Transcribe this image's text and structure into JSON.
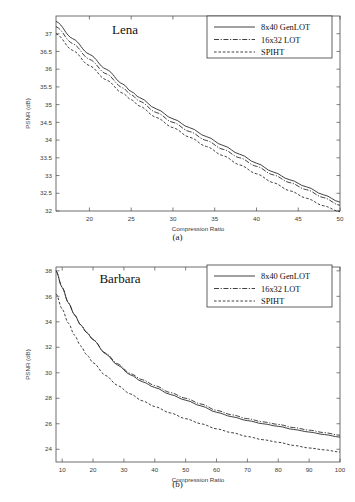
{
  "figure": {
    "caption_a": "(a)",
    "caption_b": "(b)",
    "axis_x_label": "Compression Ratio",
    "axis_y_label": "PSNR (dB)"
  },
  "legend": {
    "series1": "8x40 GenLOT",
    "series2": "16x32 LOT",
    "series3": "SPIHT"
  },
  "chart_data": [
    {
      "type": "line",
      "title": "Lena",
      "xlabel": "Compression Ratio",
      "ylabel": "PSNR (dB)",
      "xlim": [
        16,
        50
      ],
      "ylim": [
        32,
        37.5
      ],
      "xticks": [
        20,
        25,
        30,
        35,
        40,
        45,
        50
      ],
      "yticks": [
        32,
        32.5,
        33,
        33.5,
        34,
        34.5,
        35,
        35.5,
        36,
        36.5,
        37
      ],
      "grid": false,
      "legend_position": "top-right",
      "x": [
        16,
        18,
        20,
        22,
        24,
        25,
        26,
        28,
        30,
        32,
        34,
        36,
        38,
        40,
        42,
        44,
        46,
        48,
        50
      ],
      "series": [
        {
          "name": "8x40 GenLOT",
          "style": "solid",
          "values": [
            37.35,
            36.86,
            36.42,
            36.0,
            35.58,
            35.37,
            35.2,
            34.88,
            34.6,
            34.35,
            34.1,
            33.85,
            33.6,
            33.35,
            33.1,
            32.88,
            32.68,
            32.46,
            32.25
          ]
        },
        {
          "name": "16x32 LOT",
          "style": "dashdot",
          "values": [
            37.2,
            36.72,
            36.28,
            35.87,
            35.47,
            35.28,
            35.1,
            34.78,
            34.5,
            34.24,
            33.99,
            33.74,
            33.5,
            33.26,
            33.02,
            32.8,
            32.6,
            32.38,
            32.16
          ]
        },
        {
          "name": "SPIHT",
          "style": "dashed",
          "values": [
            37.0,
            36.53,
            36.1,
            35.7,
            35.32,
            35.14,
            34.96,
            34.64,
            34.35,
            34.08,
            33.82,
            33.56,
            33.3,
            33.05,
            32.8,
            32.57,
            32.36,
            32.15,
            31.98
          ]
        }
      ]
    },
    {
      "type": "line",
      "title": "Barbara",
      "xlabel": "Compression Ratio",
      "ylabel": "PSNR (dB)",
      "xlim": [
        8,
        100
      ],
      "ylim": [
        23,
        38.3
      ],
      "xticks": [
        10,
        20,
        30,
        40,
        50,
        60,
        70,
        80,
        90,
        100
      ],
      "yticks": [
        24,
        26,
        28,
        30,
        32,
        34,
        36,
        38
      ],
      "grid": false,
      "legend_position": "top-right",
      "x": [
        8,
        10,
        12,
        14,
        16,
        18,
        20,
        24,
        28,
        32,
        36,
        40,
        45,
        50,
        55,
        60,
        65,
        70,
        75,
        80,
        85,
        90,
        95,
        100
      ],
      "series": [
        {
          "name": "8x40 GenLOT",
          "style": "solid",
          "values": [
            38.0,
            36.7,
            35.5,
            34.55,
            33.75,
            33.15,
            32.6,
            31.5,
            30.6,
            29.85,
            29.3,
            28.85,
            28.3,
            27.85,
            27.4,
            26.9,
            26.55,
            26.25,
            26.0,
            25.8,
            25.55,
            25.35,
            25.15,
            24.95
          ]
        },
        {
          "name": "16x32 LOT",
          "style": "dashdot",
          "values": [
            38.0,
            36.7,
            35.5,
            34.55,
            33.75,
            33.15,
            32.62,
            31.55,
            30.7,
            29.95,
            29.45,
            29.0,
            28.45,
            28.0,
            27.55,
            27.05,
            26.7,
            26.4,
            26.15,
            25.95,
            25.7,
            25.5,
            25.3,
            25.1
          ]
        },
        {
          "name": "SPIHT",
          "style": "dashed",
          "values": [
            36.2,
            35.0,
            33.9,
            32.95,
            32.1,
            31.4,
            30.8,
            29.8,
            29.0,
            28.35,
            27.8,
            27.35,
            26.85,
            26.4,
            26.0,
            25.6,
            25.3,
            25.0,
            24.75,
            24.55,
            24.3,
            24.1,
            23.95,
            23.78
          ]
        }
      ]
    }
  ]
}
